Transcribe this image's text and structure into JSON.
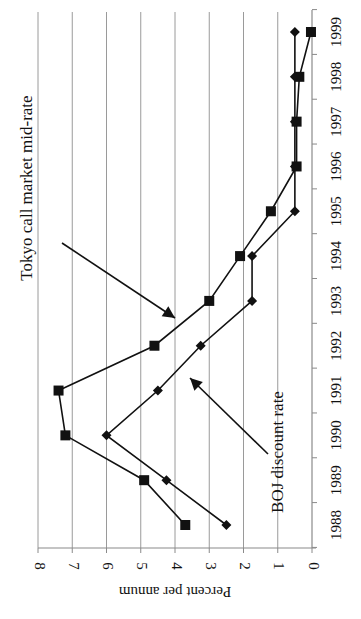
{
  "chart_data": {
    "type": "line",
    "orientation": "rotated-90-clockwise",
    "title": "",
    "xlabel": "",
    "ylabel": "Percent per annum",
    "ylim": [
      0,
      8
    ],
    "y_ticks": [
      "0",
      "1",
      "2",
      "3",
      "4",
      "5",
      "6",
      "7",
      "8"
    ],
    "categories": [
      "1988",
      "1989",
      "1990",
      "1991",
      "1992",
      "1993",
      "1994",
      "1995",
      "1996",
      "1997",
      "1998",
      "1999"
    ],
    "grid": true,
    "legend": "none (inline annotations with arrows)",
    "series": [
      {
        "name": "Tokyo call market mid-rate",
        "marker": "square",
        "values": [
          3.7,
          4.9,
          7.2,
          7.4,
          4.6,
          3.0,
          2.1,
          1.2,
          0.45,
          0.45,
          0.37,
          0.03
        ]
      },
      {
        "name": "BOJ discount rate",
        "marker": "diamond",
        "values": [
          2.5,
          4.25,
          6.0,
          4.5,
          3.25,
          1.75,
          1.75,
          0.5,
          0.5,
          0.5,
          0.5,
          0.5
        ]
      }
    ],
    "annotations": [
      {
        "text": "Tokyo call market mid-rate",
        "points_to": "Tokyo call market mid-rate"
      },
      {
        "text": "BOJ discount rate",
        "points_to": "BOJ discount rate"
      }
    ]
  }
}
